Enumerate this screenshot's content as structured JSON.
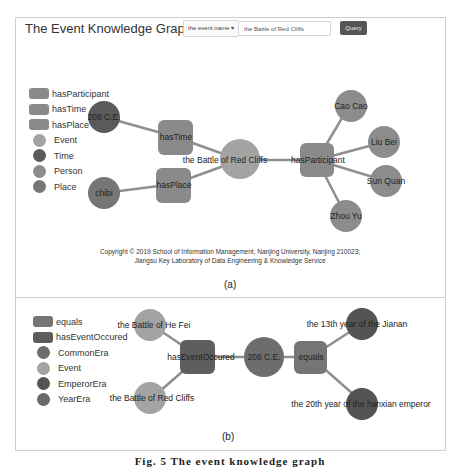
{
  "header": {
    "title": "The Event Knowledge Graph",
    "search_type": "the event name",
    "search_value": "the Battle of Red Cliffs",
    "query_label": "Query"
  },
  "colors": {
    "relation": "#8a8a8a",
    "relation_dark": "#5e5e5e",
    "event": "#a3a3a3",
    "time": "#5a5a5a",
    "person": "#8c8c8c",
    "place": "#767676",
    "common_era": "#6d6d6d",
    "emperor_era": "#545454",
    "year_era": "#6a6a6a",
    "edge": "#8f8f8f"
  },
  "panel_a": {
    "legend": [
      {
        "label": "hasParticipant",
        "shape": "rect",
        "color": "#8a8a8a"
      },
      {
        "label": "hasTime",
        "shape": "rect",
        "color": "#8a8a8a"
      },
      {
        "label": "hasPlace",
        "shape": "rect",
        "color": "#8a8a8a"
      },
      {
        "label": "Event",
        "shape": "circle",
        "color": "#a3a3a3"
      },
      {
        "label": "Time",
        "shape": "circle",
        "color": "#5a5a5a"
      },
      {
        "label": "Person",
        "shape": "circle",
        "color": "#8c8c8c"
      },
      {
        "label": "Place",
        "shape": "circle",
        "color": "#767676"
      }
    ],
    "nodes": {
      "event": "the Battle of Red Cliffs",
      "has_time": "hasTime",
      "has_place": "hasPlace",
      "has_participant": "hasParticipant",
      "time": "208 C.E.",
      "place": "chibi",
      "person_1": "Cao Cao",
      "person_2": "Liu Bei",
      "person_3": "Sun Quan",
      "person_4": "Zhou Yu"
    },
    "copyright_line1": "Copyright © 2019 School of Information Management, Nanjing University, Nanjing 210023;",
    "copyright_line2": "Jiangsu Key Laboratory of Data Engineering & Knowledge Service",
    "caption": "(a)"
  },
  "panel_b": {
    "legend": [
      {
        "label": "equals",
        "shape": "rect",
        "color": "#757575"
      },
      {
        "label": "hasEventOccured",
        "shape": "rect",
        "color": "#5e5e5e"
      },
      {
        "label": "CommonEra",
        "shape": "circle",
        "color": "#6d6d6d"
      },
      {
        "label": "Event",
        "shape": "circle",
        "color": "#a3a3a3"
      },
      {
        "label": "EmperorEra",
        "shape": "circle",
        "color": "#545454"
      },
      {
        "label": "YearEra",
        "shape": "circle",
        "color": "#6a6a6a"
      }
    ],
    "nodes": {
      "event_1": "the Battle of He Fei",
      "event_2": "the Battle of Red Cliffs",
      "has_event_occured": "hasEventOccured",
      "common_era": "208 C.E.",
      "equals": "equals",
      "era_1": "the 13th year of the Jianan",
      "era_2": "the 20th year of the hanxian emperor"
    },
    "caption": "(b)"
  },
  "figure_caption": "Fig. 5  The event knowledge graph"
}
